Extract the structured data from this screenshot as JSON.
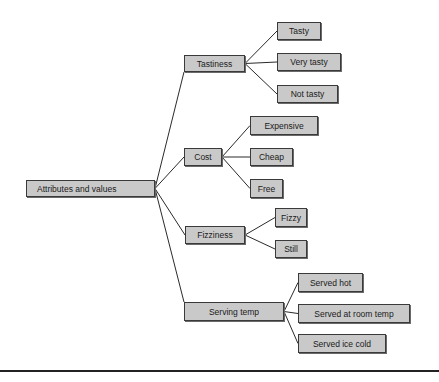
{
  "diagram": {
    "root": {
      "label": "Attributes and values",
      "box": [
        26,
        180,
        129,
        17
      ]
    },
    "attributes": [
      {
        "label": "Tastiness",
        "box": [
          184,
          55,
          61,
          17
        ],
        "values": [
          {
            "label": "Tasty",
            "box": [
              277,
              22,
              44,
              18
            ]
          },
          {
            "label": "Very tasty",
            "box": [
              277,
              53,
              64,
              18
            ]
          },
          {
            "label": "Not tasty",
            "box": [
              277,
              85,
              61,
              18
            ]
          }
        ]
      },
      {
        "label": "Cost",
        "box": [
          184,
          148,
          38,
          18
        ],
        "values": [
          {
            "label": "Expensive",
            "box": [
              250,
              116,
              68,
              19
            ]
          },
          {
            "label": "Cheap",
            "box": [
              250,
              148,
              43,
              18
            ]
          },
          {
            "label": "Free",
            "box": [
              250,
              179,
              33,
              19
            ]
          }
        ]
      },
      {
        "label": "Fizziness",
        "box": [
          185,
          226,
          60,
          18
        ],
        "values": [
          {
            "label": "Fizzy",
            "box": [
              275,
              208,
              32,
              19
            ]
          },
          {
            "label": "Still",
            "box": [
              275,
              240,
              32,
              18
            ]
          }
        ]
      },
      {
        "label": "Serving temp",
        "box": [
          184,
          302,
          100,
          19
        ],
        "values": [
          {
            "label": "Served hot",
            "box": [
              298,
              273,
              65,
              19
            ]
          },
          {
            "label": "Served at room temp",
            "box": [
              298,
              304,
              112,
              19
            ]
          },
          {
            "label": "Served ice cold",
            "box": [
              298,
              334,
              88,
              19
            ]
          }
        ]
      }
    ]
  },
  "colors": {
    "node_fill": "#c9c9c9",
    "node_border": "#3a3a3a",
    "connector": "#2a2a2a",
    "rule": "#222222"
  }
}
